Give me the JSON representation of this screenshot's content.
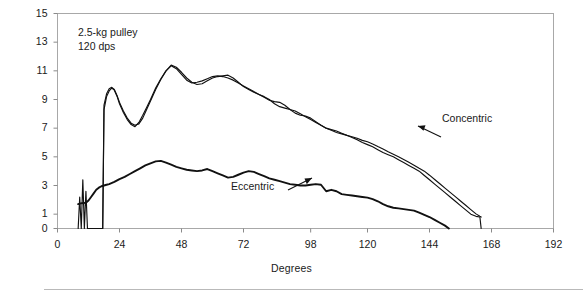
{
  "figure": {
    "background_color": "#ffffff",
    "frame_color": "#a8a8a8",
    "line_color": "#111111"
  },
  "annotation": {
    "line1": "2.5-kg pulley",
    "line2": "120 dps",
    "text": "2.5-kg pulley\n120 dps"
  },
  "series_labels": {
    "concentric": "Concentric",
    "eccentric": "Eccentric"
  },
  "chart_data": {
    "type": "line",
    "title": "",
    "subtitle": "",
    "xlabel": "Degrees",
    "ylabel": "Ft - lb",
    "xlim": [
      0,
      192
    ],
    "ylim": [
      0,
      15
    ],
    "grid": false,
    "legend_position": "inline-annotations",
    "xticks": [
      0,
      24,
      48,
      72,
      98,
      120,
      144,
      168,
      192
    ],
    "xticklabels": [
      "0",
      "24",
      "48",
      "72",
      "98",
      "120",
      "144",
      "168",
      "192"
    ],
    "yticks": [
      0,
      1,
      3,
      5,
      7,
      9,
      11,
      13,
      15
    ],
    "yticklabels": [
      "0",
      "1",
      "3",
      "5",
      "7",
      "9",
      "11",
      "13",
      "15"
    ],
    "annotations": [
      {
        "text": "2.5-kg pulley",
        "x": 10,
        "y": 14.0
      },
      {
        "text": "120 dps",
        "x": 10,
        "y": 13.0
      },
      {
        "text": "Concentric",
        "x": 138,
        "y": 7.2,
        "arrow_to_x": 130,
        "arrow_to_y": 5.2
      },
      {
        "text": "Eccentric",
        "x": 80,
        "y": 1.9,
        "arrow_to_x": 99,
        "arrow_to_y": 3.1
      }
    ],
    "series": [
      {
        "name": "Concentric",
        "description": "Upper torque curve, two overlapping repetition traces that weave and cross forming lens shapes; rises steeply at ~18 deg, peaks ~11.4 at 44 deg, declines to zero at ~164 deg.",
        "x": [
          8,
          8.6,
          9.2,
          9.8,
          10.4,
          11,
          11.6,
          17.5,
          18,
          19,
          20,
          21,
          22,
          23,
          24,
          25.5,
          27,
          28.5,
          30,
          31.5,
          33,
          34.5,
          36,
          38,
          40,
          42,
          44,
          46,
          48,
          50,
          52,
          54,
          56,
          58,
          60,
          62,
          64,
          66,
          68,
          70,
          72,
          74,
          76,
          78,
          80,
          82,
          84,
          86,
          88,
          90,
          92,
          94,
          96,
          98,
          100,
          102,
          104,
          106,
          108,
          110,
          112,
          114,
          116,
          118,
          120,
          122,
          124,
          126,
          128,
          130,
          132,
          134,
          136,
          138,
          140,
          142,
          144,
          146,
          148,
          150,
          152,
          154,
          156,
          158,
          160,
          162,
          163.5,
          164
        ],
        "y": [
          0,
          2.2,
          0,
          3.4,
          0,
          2.6,
          0,
          0,
          8.6,
          9.4,
          9.75,
          9.85,
          9.7,
          9.3,
          8.8,
          8.2,
          7.7,
          7.35,
          7.2,
          7.3,
          7.7,
          8.3,
          8.9,
          9.7,
          10.4,
          11.0,
          11.4,
          11.25,
          10.9,
          10.5,
          10.2,
          10.05,
          10.1,
          10.3,
          10.5,
          10.6,
          10.65,
          10.7,
          10.5,
          10.2,
          9.9,
          9.7,
          9.5,
          9.35,
          9.2,
          9.0,
          8.7,
          8.5,
          8.4,
          8.3,
          8.2,
          8.0,
          7.8,
          7.6,
          7.4,
          7.2,
          7.0,
          6.85,
          6.7,
          6.6,
          6.5,
          6.35,
          6.2,
          6.0,
          5.85,
          5.7,
          5.5,
          5.3,
          5.15,
          5.0,
          4.8,
          4.6,
          4.4,
          4.2,
          4.0,
          3.7,
          3.4,
          3.1,
          2.8,
          2.5,
          2.2,
          1.9,
          1.6,
          1.3,
          1.0,
          0.85,
          0.8,
          0
        ]
      },
      {
        "name": "Concentric (second trace)",
        "description": "Second overlapping repetition of the concentric curve, slightly offset producing the eye/lens crossings.",
        "x": [
          17.5,
          18,
          19,
          20,
          21,
          22,
          23,
          24,
          25.5,
          27,
          28.5,
          30,
          31.5,
          33,
          34.5,
          36,
          38,
          40,
          42,
          44,
          46,
          48,
          50,
          52,
          54,
          56,
          58,
          60,
          62,
          64,
          66,
          68,
          70,
          72,
          74,
          76,
          78,
          80,
          82,
          84,
          86,
          88,
          90,
          92,
          94,
          96,
          98,
          100,
          102,
          104,
          106,
          108,
          110,
          112,
          114,
          116,
          118,
          120,
          122,
          124,
          126,
          128,
          130,
          132,
          134,
          136,
          138,
          140,
          142,
          144,
          146,
          148,
          150,
          152,
          154,
          156,
          158,
          160,
          162,
          163.5,
          164
        ],
        "y": [
          0,
          8.3,
          9.2,
          9.6,
          9.8,
          9.65,
          9.25,
          8.7,
          8.1,
          7.6,
          7.25,
          7.1,
          7.4,
          7.9,
          8.45,
          9.0,
          9.8,
          10.45,
          11.0,
          11.35,
          11.15,
          10.75,
          10.35,
          10.15,
          10.2,
          10.3,
          10.45,
          10.6,
          10.65,
          10.6,
          10.5,
          10.35,
          10.15,
          9.95,
          9.75,
          9.55,
          9.35,
          9.15,
          8.95,
          8.85,
          8.8,
          8.6,
          8.3,
          8.05,
          7.9,
          7.85,
          7.7,
          7.45,
          7.2,
          7.0,
          6.9,
          6.8,
          6.65,
          6.5,
          6.4,
          6.3,
          6.15,
          6.05,
          5.9,
          5.72,
          5.55,
          5.35,
          5.18,
          5.0,
          4.82,
          4.62,
          4.42,
          4.2,
          4.0,
          3.72,
          3.42,
          3.12,
          2.82,
          2.52,
          2.22,
          1.92,
          1.62,
          1.32,
          1.02,
          0.85,
          0.8
        ]
      },
      {
        "name": "Eccentric",
        "description": "Lower torque curve, drawn as a thicker doubled trace; starts ~1.7 at 8 deg, peaks ~4.7 at 40 deg, declines to zero at ~152 deg.",
        "x": [
          8,
          9,
          10,
          11,
          12,
          13,
          14,
          15,
          16,
          17,
          18,
          19,
          20,
          22,
          24,
          26,
          28,
          30,
          32,
          34,
          36,
          38,
          40,
          42,
          44,
          46,
          48,
          50,
          52,
          54,
          56,
          58,
          60,
          62,
          64,
          66,
          68,
          70,
          72,
          74,
          76,
          78,
          80,
          82,
          84,
          86,
          88,
          90,
          92,
          94,
          96,
          98,
          100,
          102,
          104,
          106,
          108,
          110,
          112,
          114,
          116,
          118,
          120,
          122,
          124,
          126,
          128,
          130,
          132,
          134,
          136,
          138,
          140,
          142,
          144,
          146,
          148,
          150,
          151.5
        ],
        "y": [
          1.7,
          1.75,
          1.78,
          1.8,
          1.95,
          2.2,
          2.45,
          2.7,
          2.85,
          2.95,
          3.0,
          3.05,
          3.1,
          3.25,
          3.45,
          3.6,
          3.8,
          4.0,
          4.2,
          4.4,
          4.55,
          4.68,
          4.72,
          4.6,
          4.45,
          4.3,
          4.2,
          4.1,
          4.05,
          4.0,
          4.05,
          4.15,
          4.0,
          3.85,
          3.7,
          3.55,
          3.6,
          3.75,
          3.9,
          4.0,
          3.95,
          3.8,
          3.65,
          3.5,
          3.4,
          3.3,
          3.2,
          3.1,
          3.05,
          3.0,
          3.0,
          3.05,
          3.1,
          3.05,
          2.6,
          2.7,
          2.6,
          2.4,
          2.35,
          2.3,
          2.25,
          2.2,
          2.15,
          2.05,
          1.9,
          1.7,
          1.55,
          1.45,
          1.4,
          1.35,
          1.3,
          1.25,
          1.1,
          0.95,
          0.8,
          0.6,
          0.4,
          0.2,
          0
        ]
      }
    ]
  }
}
